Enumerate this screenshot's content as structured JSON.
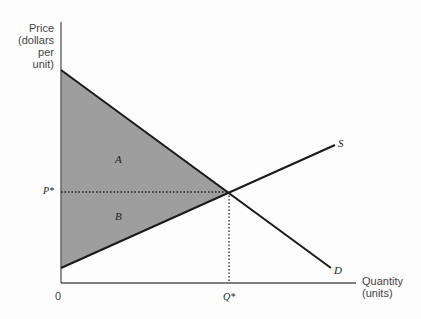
{
  "axes": {
    "y_label_lines": [
      "Price",
      "(dollars",
      "per unit)"
    ],
    "x_label_lines": [
      "Quantity",
      "(units)"
    ],
    "origin_label": "0"
  },
  "curves": {
    "supply_label": "S",
    "demand_label": "D"
  },
  "equilibrium": {
    "price_label": "P*",
    "quantity_label": "Q*"
  },
  "regions": {
    "a_label": "A",
    "b_label": "B"
  },
  "colors": {
    "shade": "#9e9e9e",
    "line": "#1a1a1a",
    "axis": "#555555"
  }
}
